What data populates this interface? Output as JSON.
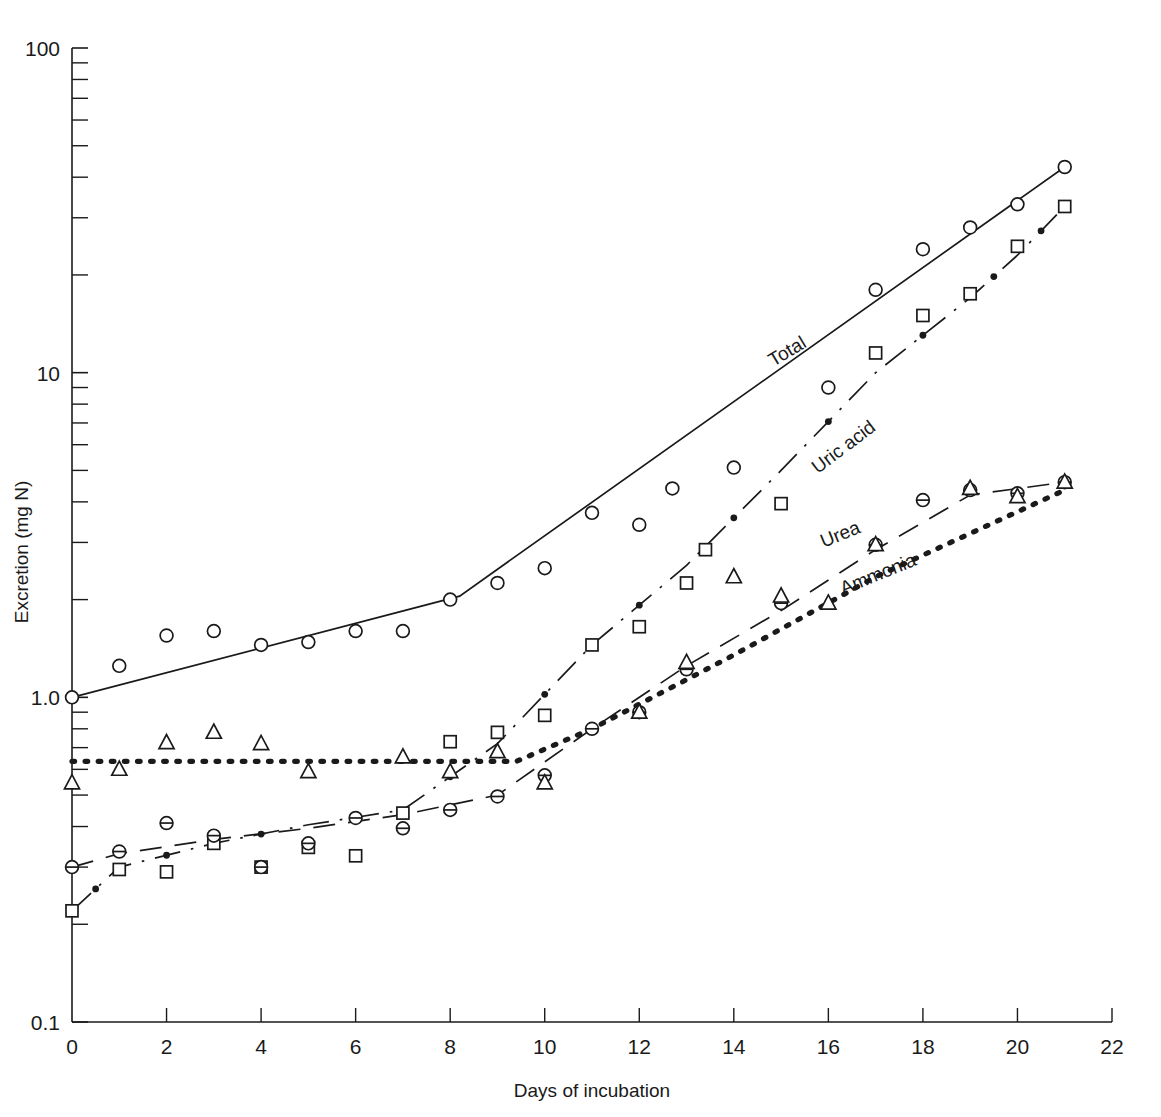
{
  "chart_data": {
    "type": "line",
    "title": "",
    "xlabel": "Days of incubation",
    "ylabel": "Excretion (mg N)",
    "xlim": [
      0,
      22
    ],
    "ylim": [
      0.1,
      100
    ],
    "yscale": "log",
    "xscale": "linear",
    "grid": false,
    "legend_position": "inline-labels",
    "x_ticks": [
      0,
      2,
      4,
      6,
      8,
      10,
      12,
      14,
      16,
      18,
      20,
      22
    ],
    "x_tick_labels": [
      "0",
      "2",
      "4",
      "6",
      "8",
      "10",
      "12",
      "14",
      "16",
      "18",
      "20",
      "22"
    ],
    "y_ticks": [
      0.1,
      1.0,
      10,
      100
    ],
    "y_tick_labels": [
      "0.1",
      "1.0",
      "10",
      "100"
    ],
    "y_minor_ticks": [
      0.2,
      0.3,
      0.4,
      0.5,
      0.6,
      0.7,
      0.8,
      0.9,
      2,
      3,
      4,
      5,
      6,
      7,
      8,
      9,
      20,
      30,
      40,
      50,
      60,
      70,
      80,
      90
    ],
    "series": [
      {
        "name": "Total",
        "marker": "open-circle",
        "linestyle": "solid",
        "label_x": 15.2,
        "label_y": 11.2,
        "label_rotation": -31,
        "fit_line": [
          {
            "x": 0.0,
            "y": 1.0
          },
          {
            "x": 8.2,
            "y": 2.05
          },
          {
            "x": 21.0,
            "y": 43.0
          }
        ],
        "points": [
          {
            "x": 0,
            "y": 1.0
          },
          {
            "x": 1,
            "y": 1.25
          },
          {
            "x": 2,
            "y": 1.55
          },
          {
            "x": 3,
            "y": 1.6
          },
          {
            "x": 4,
            "y": 1.45
          },
          {
            "x": 5,
            "y": 1.48
          },
          {
            "x": 6,
            "y": 1.6
          },
          {
            "x": 7,
            "y": 1.6
          },
          {
            "x": 8,
            "y": 2.0
          },
          {
            "x": 9,
            "y": 2.25
          },
          {
            "x": 10,
            "y": 2.5
          },
          {
            "x": 11,
            "y": 3.7
          },
          {
            "x": 12,
            "y": 3.4
          },
          {
            "x": 12.7,
            "y": 4.4
          },
          {
            "x": 14,
            "y": 5.1
          },
          {
            "x": 16,
            "y": 9.0
          },
          {
            "x": 17,
            "y": 18.0
          },
          {
            "x": 18,
            "y": 24.0
          },
          {
            "x": 19,
            "y": 28.0
          },
          {
            "x": 20,
            "y": 33.0
          },
          {
            "x": 21,
            "y": 43.0
          }
        ]
      },
      {
        "name": "Uric acid",
        "marker": "open-square",
        "linestyle": "dashdot",
        "label_x": 16.4,
        "label_y": 5.7,
        "label_rotation": -37,
        "fit_line": [
          {
            "x": 0.0,
            "y": 0.22
          },
          {
            "x": 1.0,
            "y": 0.3
          },
          {
            "x": 3.0,
            "y": 0.355
          },
          {
            "x": 5.0,
            "y": 0.405
          },
          {
            "x": 7.0,
            "y": 0.45
          },
          {
            "x": 9.0,
            "y": 0.72
          },
          {
            "x": 11.0,
            "y": 1.45
          },
          {
            "x": 13.0,
            "y": 2.55
          },
          {
            "x": 15.0,
            "y": 5.0
          },
          {
            "x": 17.0,
            "y": 10.0
          },
          {
            "x": 19.0,
            "y": 17.0
          },
          {
            "x": 20.0,
            "y": 23.0
          },
          {
            "x": 21.0,
            "y": 32.5
          }
        ],
        "points": [
          {
            "x": 0,
            "y": 0.22
          },
          {
            "x": 1,
            "y": 0.295
          },
          {
            "x": 2,
            "y": 0.29
          },
          {
            "x": 3,
            "y": 0.355
          },
          {
            "x": 4,
            "y": 0.3
          },
          {
            "x": 5,
            "y": 0.345
          },
          {
            "x": 6,
            "y": 0.325
          },
          {
            "x": 7,
            "y": 0.44
          },
          {
            "x": 8,
            "y": 0.73
          },
          {
            "x": 9,
            "y": 0.78
          },
          {
            "x": 10,
            "y": 0.88
          },
          {
            "x": 11,
            "y": 1.45
          },
          {
            "x": 12,
            "y": 1.65
          },
          {
            "x": 13,
            "y": 2.25
          },
          {
            "x": 13.4,
            "y": 2.85
          },
          {
            "x": 15,
            "y": 3.95
          },
          {
            "x": 17,
            "y": 11.5
          },
          {
            "x": 18,
            "y": 15.0
          },
          {
            "x": 19,
            "y": 17.5
          },
          {
            "x": 20,
            "y": 24.5
          },
          {
            "x": 21,
            "y": 32.5
          }
        ]
      },
      {
        "name": "Urea",
        "marker": "circle-hline",
        "linestyle": "dashed",
        "label_x": 16.3,
        "label_y": 3.05,
        "label_rotation": -22,
        "fit_line": [
          {
            "x": 0.0,
            "y": 0.3
          },
          {
            "x": 1.0,
            "y": 0.33
          },
          {
            "x": 3.0,
            "y": 0.365
          },
          {
            "x": 5.0,
            "y": 0.395
          },
          {
            "x": 7.0,
            "y": 0.435
          },
          {
            "x": 9.0,
            "y": 0.5
          },
          {
            "x": 11.0,
            "y": 0.8
          },
          {
            "x": 13.0,
            "y": 1.25
          },
          {
            "x": 15.0,
            "y": 1.85
          },
          {
            "x": 17.0,
            "y": 2.85
          },
          {
            "x": 19.0,
            "y": 4.2
          },
          {
            "x": 21.0,
            "y": 4.6
          }
        ],
        "points": [
          {
            "x": 0,
            "y": 0.3
          },
          {
            "x": 1,
            "y": 0.335
          },
          {
            "x": 2,
            "y": 0.41
          },
          {
            "x": 3,
            "y": 0.375
          },
          {
            "x": 4,
            "y": 0.3
          },
          {
            "x": 5,
            "y": 0.355
          },
          {
            "x": 6,
            "y": 0.425
          },
          {
            "x": 7,
            "y": 0.395
          },
          {
            "x": 8,
            "y": 0.45
          },
          {
            "x": 9,
            "y": 0.495
          },
          {
            "x": 10,
            "y": 0.575
          },
          {
            "x": 11,
            "y": 0.8
          },
          {
            "x": 12,
            "y": 0.9
          },
          {
            "x": 13,
            "y": 1.22
          },
          {
            "x": 15,
            "y": 1.95
          },
          {
            "x": 17,
            "y": 2.95
          },
          {
            "x": 18,
            "y": 4.05
          },
          {
            "x": 19,
            "y": 4.35
          },
          {
            "x": 20,
            "y": 4.25
          },
          {
            "x": 21,
            "y": 4.6
          }
        ]
      },
      {
        "name": "Ammonia",
        "marker": "open-triangle",
        "linestyle": "dotted",
        "label_x": 17.1,
        "label_y": 2.3,
        "label_rotation": -22,
        "fit_line": [
          {
            "x": 0.0,
            "y": 0.635
          },
          {
            "x": 9.4,
            "y": 0.635
          },
          {
            "x": 11.0,
            "y": 0.8
          },
          {
            "x": 14.0,
            "y": 1.35
          },
          {
            "x": 17.0,
            "y": 2.35
          },
          {
            "x": 21.0,
            "y": 4.35
          }
        ],
        "points": [
          {
            "x": 0,
            "y": 0.545
          },
          {
            "x": 1,
            "y": 0.6
          },
          {
            "x": 2,
            "y": 0.725
          },
          {
            "x": 3,
            "y": 0.78
          },
          {
            "x": 4,
            "y": 0.72
          },
          {
            "x": 5,
            "y": 0.59
          },
          {
            "x": 7,
            "y": 0.655
          },
          {
            "x": 8,
            "y": 0.59
          },
          {
            "x": 9,
            "y": 0.68
          },
          {
            "x": 10,
            "y": 0.545
          },
          {
            "x": 12,
            "y": 0.9
          },
          {
            "x": 13,
            "y": 1.28
          },
          {
            "x": 14,
            "y": 2.35
          },
          {
            "x": 15,
            "y": 2.05
          },
          {
            "x": 16,
            "y": 1.95
          },
          {
            "x": 17,
            "y": 2.95
          },
          {
            "x": 19,
            "y": 4.4
          },
          {
            "x": 20,
            "y": 4.15
          },
          {
            "x": 21,
            "y": 4.6
          }
        ]
      }
    ]
  },
  "figure": {
    "background_color": "#ffffff",
    "ink_color": "#1a1a1a"
  }
}
